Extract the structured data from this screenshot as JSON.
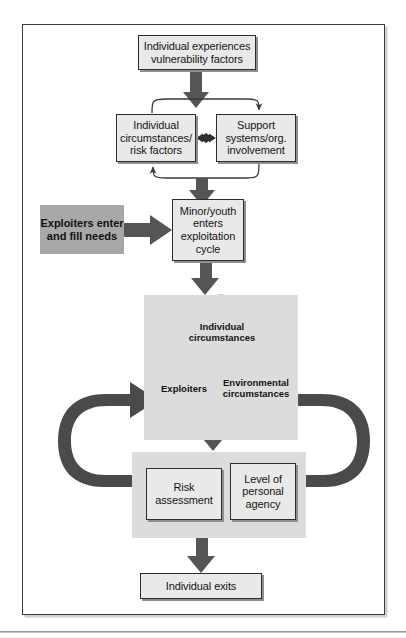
{
  "figure": {
    "orientation": "vertical flowchart with feedback loops"
  },
  "nodes": {
    "vulnerability": "Individual experiences vulnerability factors",
    "individual_circumstances": "Individual circumstances/ risk factors",
    "support_systems": "Support systems/org. involvement",
    "minor_youth": "Minor/youth enters exploitation cycle",
    "exploiters_fill_needs": "Exploiters enter and fill needs",
    "risk_assessment": "Risk assessment",
    "personal_agency": "Level of personal agency",
    "individual_exits": "Individual exits"
  },
  "venn": {
    "top_circle": "Individual circumstances",
    "left_circle": "Exploiters",
    "right_circle": "Environmental circumstances"
  },
  "colors": {
    "box_fill": "#e9e9e9",
    "box_border": "#2c2c2c",
    "panel_fill": "#dcdcdc",
    "highlight_fill": "#a8a8a8",
    "arrow_thick": "#4a4a4a",
    "arrow_thin": "#3a3a3a",
    "venn_top": "#9a9a9a",
    "venn_left": "#b0b0b0",
    "venn_right": "#c8c8c8",
    "frame_border": "#3b3b3b"
  }
}
